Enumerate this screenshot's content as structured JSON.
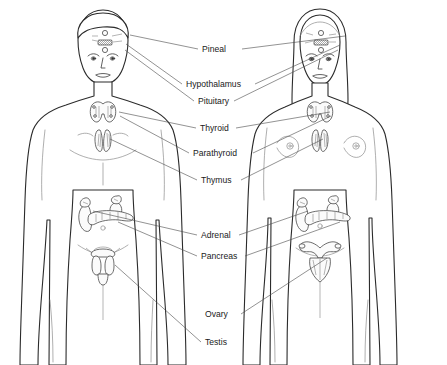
{
  "figure": {
    "subjects": [
      {
        "id": "male",
        "label": "male figure",
        "side": "left"
      },
      {
        "id": "female",
        "label": "female figure",
        "side": "right"
      }
    ]
  },
  "labels": [
    {
      "id": "pineal",
      "text": "Pineal",
      "x": 202,
      "y": 52,
      "anchor": "start",
      "leaders": [
        [
          198,
          49,
          130,
          35
        ],
        [
          242,
          49,
          345,
          36
        ]
      ]
    },
    {
      "id": "hypothalamus",
      "text": "Hypothalamus",
      "x": 186,
      "y": 87,
      "anchor": "start",
      "leaders": [
        [
          182,
          84,
          126,
          44
        ],
        [
          255,
          84,
          340,
          45
        ]
      ]
    },
    {
      "id": "pituitary",
      "text": "Pituitary",
      "x": 198,
      "y": 104,
      "anchor": "start",
      "leaders": [
        [
          194,
          101,
          125,
          50
        ],
        [
          234,
          101,
          338,
          50
        ]
      ]
    },
    {
      "id": "thyroid",
      "text": "Thyroid",
      "x": 200,
      "y": 131,
      "anchor": "start",
      "leaders": [
        [
          196,
          128,
          119,
          112
        ],
        [
          236,
          128,
          330,
          112
        ]
      ]
    },
    {
      "id": "parathyroid",
      "text": "Parathyroid",
      "x": 193,
      "y": 156,
      "anchor": "start",
      "leaders": [
        [
          189,
          153,
          120,
          116
        ],
        [
          253,
          153,
          331,
          116
        ]
      ]
    },
    {
      "id": "thymus",
      "text": "Thymus",
      "x": 201,
      "y": 183,
      "anchor": "start",
      "leaders": [
        [
          197,
          180,
          110,
          139
        ],
        [
          241,
          180,
          323,
          139
        ]
      ]
    },
    {
      "id": "adrenal",
      "text": "Adrenal",
      "x": 201,
      "y": 238,
      "anchor": "start",
      "leaders": [
        [
          197,
          235,
          93,
          211
        ],
        [
          239,
          235,
          308,
          211
        ]
      ]
    },
    {
      "id": "pancreas",
      "text": "Pancreas",
      "x": 201,
      "y": 259,
      "anchor": "start",
      "leaders": [
        [
          197,
          256,
          118,
          222
        ],
        [
          245,
          256,
          340,
          222
        ]
      ]
    },
    {
      "id": "ovary",
      "text": "Ovary",
      "x": 205,
      "y": 317,
      "anchor": "start",
      "leaders": [
        [
          241,
          314,
          327,
          258
        ]
      ]
    },
    {
      "id": "testis",
      "text": "Testis",
      "x": 205,
      "y": 345,
      "anchor": "start",
      "leaders": [
        [
          201,
          342,
          115,
          265
        ]
      ]
    }
  ],
  "colors": {
    "background": "#ffffff",
    "outline": "#2b2b2b",
    "inner_line": "#8d8d8d",
    "leader_line": "#4a4a4a",
    "label_text": "#1a1a1a",
    "organ_fill": "#fbfbfb"
  }
}
